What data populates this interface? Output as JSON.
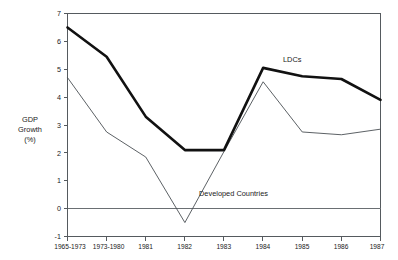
{
  "chart_data": {
    "type": "line",
    "title": "",
    "subtitle": "",
    "xlabel": "",
    "ylabel": "GDP Growth (%)",
    "ylabel_lines": [
      "GDP",
      "Growth",
      "(%)"
    ],
    "categories": [
      "1965-1973",
      "1973-1980",
      "1981",
      "1982",
      "1983",
      "1984",
      "1985",
      "1986",
      "1987"
    ],
    "ylim": [
      -1,
      7
    ],
    "yticks": [
      -1,
      0,
      1,
      2,
      3,
      4,
      5,
      6,
      7
    ],
    "ytick_labels": [
      "-1",
      "0",
      "1",
      "2",
      "3",
      "4",
      "5",
      "6",
      "7"
    ],
    "grid": false,
    "zero_line": true,
    "legend_position": "inline-annotations",
    "series": [
      {
        "name": "LDCs",
        "style": "thick",
        "color": "#111111",
        "values": [
          6.5,
          5.45,
          3.3,
          2.1,
          2.1,
          5.05,
          4.75,
          4.65,
          3.9
        ]
      },
      {
        "name": "Developed Countries",
        "style": "thin",
        "color": "#4a4f54",
        "values": [
          4.7,
          2.75,
          1.85,
          -0.5,
          2.05,
          4.55,
          2.75,
          2.65,
          2.85
        ]
      }
    ],
    "annotations": [
      {
        "text": "LDCs",
        "series": "LDCs"
      },
      {
        "text": "Developed Countries",
        "series": "Developed Countries"
      }
    ]
  }
}
